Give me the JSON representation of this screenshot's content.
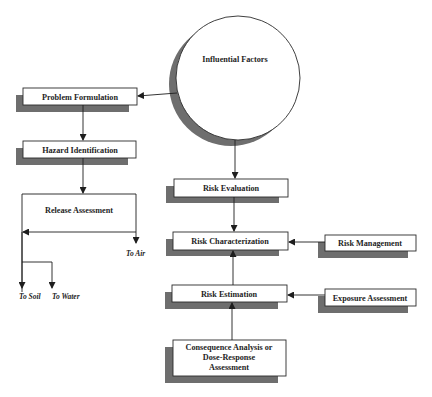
{
  "diagram": {
    "type": "risk assessment flowchart",
    "colors": {
      "box_fill": "#ffffff",
      "box_stroke": "#2a2a2a",
      "shadow": "#6e6e6e",
      "line": "#1e1e1e"
    },
    "nodes": {
      "influential_factors": "Influential Factors",
      "problem_formulation": "Problem Formulation",
      "hazard_identification": "Hazard Identification",
      "release_assessment": "Release Assessment",
      "risk_evaluation": "Risk Evaluation",
      "risk_characterization": "Risk Characterization",
      "risk_management": "Risk Management",
      "risk_estimation": "Risk Estimation",
      "exposure_assessment": "Exposure Assessment",
      "consequence_analysis": {
        "line1": "Consequence Analysis or",
        "line2": "Dose-Response",
        "line3": "Assessment"
      }
    },
    "release_pathways": {
      "air": "To Air",
      "soil": "To Soil",
      "water": "To Water"
    },
    "edges": [
      {
        "from": "Influential Factors",
        "to": "Problem Formulation"
      },
      {
        "from": "Problem Formulation",
        "to": "Hazard Identification"
      },
      {
        "from": "Hazard Identification",
        "to": "Release Assessment"
      },
      {
        "from": "Influential Factors",
        "to": "Risk Evaluation"
      },
      {
        "from": "Risk Evaluation",
        "to": "Risk Characterization"
      },
      {
        "from": "Risk Management",
        "to": "Risk Characterization"
      },
      {
        "from": "Risk Estimation",
        "to": "Risk Characterization"
      },
      {
        "from": "Exposure Assessment",
        "to": "Risk Estimation"
      },
      {
        "from": "Consequence Analysis or Dose-Response Assessment",
        "to": "Risk Estimation"
      }
    ]
  }
}
